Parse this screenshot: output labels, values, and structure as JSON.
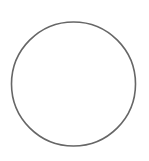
{
  "canvas": {
    "width": 149,
    "height": 161,
    "background": "#ffffff"
  },
  "shapes": [
    {
      "type": "circle",
      "name": "circle-outline",
      "cx": 73.5,
      "cy": 84,
      "r": 62,
      "stroke": "#666666",
      "stroke_width": 1.6,
      "fill": "none"
    }
  ]
}
